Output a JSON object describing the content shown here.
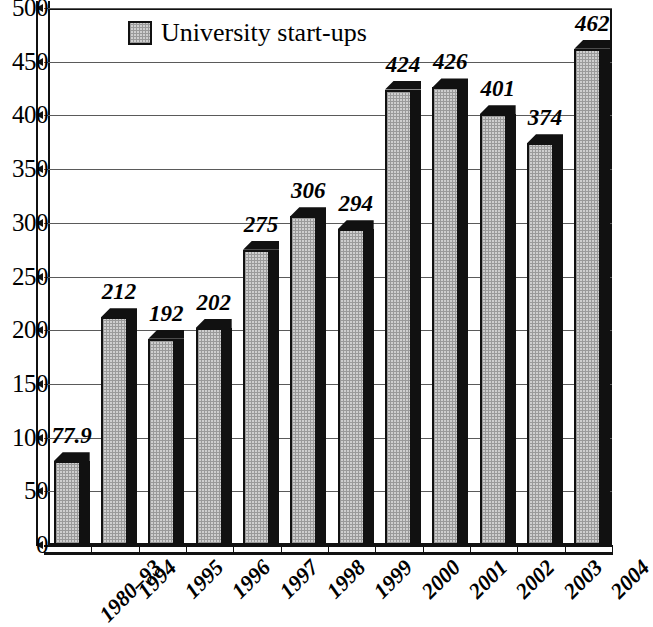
{
  "chart_data": {
    "type": "bar",
    "title": "",
    "xlabel": "",
    "ylabel": "",
    "ylim": [
      0,
      500
    ],
    "ytick_step": 50,
    "yticks": [
      "0",
      "50",
      "100",
      "150",
      "200",
      "250",
      "300",
      "350",
      "400",
      "450",
      "500"
    ],
    "grid": true,
    "legend_position": "top-left-inside",
    "categories": [
      "1980–93",
      "1994",
      "1995",
      "1996",
      "1997",
      "1998",
      "1999",
      "2000",
      "2001",
      "2002",
      "2003",
      "2004"
    ],
    "series": [
      {
        "name": "University start-ups",
        "values": [
          77.9,
          212,
          192,
          202,
          275,
          306,
          294,
          424,
          426,
          401,
          374,
          462
        ],
        "value_labels": [
          "77.9",
          "212",
          "192",
          "202",
          "275",
          "306",
          "294",
          "424",
          "426",
          "401",
          "374",
          "462"
        ],
        "color": "#cfcfcf",
        "edge_color": "#111111"
      }
    ]
  },
  "legend": {
    "entries": [
      {
        "label": "University start-ups",
        "swatch": "legend-swatch-gray"
      }
    ]
  },
  "axes": {
    "y": {
      "labels": [
        "500",
        "450",
        "400",
        "350",
        "300",
        "250",
        "200",
        "150",
        "100",
        "50",
        "0"
      ]
    },
    "x": {
      "labels": [
        "1980–93",
        "1994",
        "1995",
        "1996",
        "1997",
        "1998",
        "1999",
        "2000",
        "2001",
        "2002",
        "2003",
        "2004"
      ]
    }
  }
}
